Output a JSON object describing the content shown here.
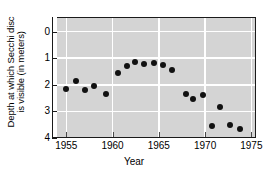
{
  "chart_data": {
    "type": "scatter",
    "title": "",
    "xlabel": "Year",
    "ylabel_line1": "Depth at which Secchi disc",
    "ylabel_line2": "is visible (in meters)",
    "xlim": [
      1954.0,
      1975.5
    ],
    "ylim": [
      4.0,
      -0.55
    ],
    "y_inverted": true,
    "grid": true,
    "legend": "none",
    "xticks": [
      1955,
      1960,
      1965,
      1970,
      1975
    ],
    "xticklabels": [
      "1955",
      "1960",
      "1965",
      "1970",
      "1975"
    ],
    "yticks": [
      0,
      1,
      2,
      3,
      4
    ],
    "yticklabels": [
      "0",
      "1",
      "2",
      "3",
      "4"
    ],
    "series": [
      {
        "name": "Secchi disc depth",
        "marker": "filled-circle",
        "color": "#111111",
        "points": [
          {
            "x": 1955.0,
            "y": 2.15
          },
          {
            "x": 1956.0,
            "y": 1.85
          },
          {
            "x": 1957.0,
            "y": 2.2
          },
          {
            "x": 1958.0,
            "y": 2.05
          },
          {
            "x": 1959.3,
            "y": 2.35
          },
          {
            "x": 1960.6,
            "y": 1.55
          },
          {
            "x": 1961.6,
            "y": 1.3
          },
          {
            "x": 1962.4,
            "y": 1.15
          },
          {
            "x": 1963.4,
            "y": 1.22
          },
          {
            "x": 1964.5,
            "y": 1.17
          },
          {
            "x": 1965.4,
            "y": 1.27
          },
          {
            "x": 1966.4,
            "y": 1.45
          },
          {
            "x": 1967.9,
            "y": 2.35
          },
          {
            "x": 1968.7,
            "y": 2.55
          },
          {
            "x": 1969.8,
            "y": 2.4
          },
          {
            "x": 1970.7,
            "y": 3.55
          },
          {
            "x": 1971.6,
            "y": 2.85
          },
          {
            "x": 1972.7,
            "y": 3.5
          },
          {
            "x": 1973.8,
            "y": 3.65
          }
        ]
      }
    ]
  },
  "axes": {
    "y_title_line1": "Depth at which Secchi disc",
    "y_title_line2": "is visible (in meters)",
    "x_title": "Year"
  }
}
